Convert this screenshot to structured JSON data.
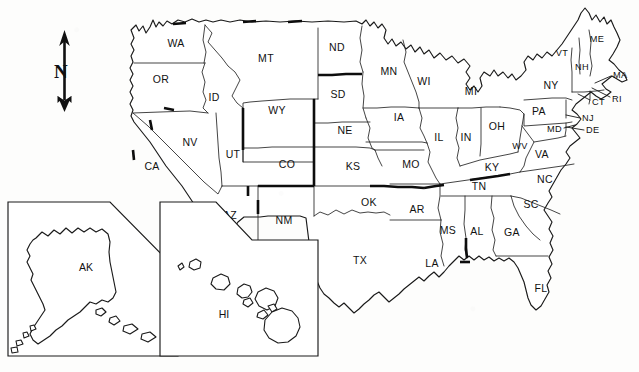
{
  "document": {
    "kind": "outline-map",
    "title": "United States — State Outline Map",
    "region": "United States of America",
    "projection_note": "lower 48 with Alaska and Hawaii insets"
  },
  "compass": {
    "name": "north-arrow",
    "label": "N",
    "direction": "north",
    "x": 65,
    "y": 72
  },
  "legend": {
    "bold_border_meaning": "emphasized / highlighted state boundaries"
  },
  "insets": [
    {
      "id": "ak",
      "label": "AK",
      "name": "Alaska",
      "label_x": 86,
      "label_y": 268
    },
    {
      "id": "hi",
      "label": "HI",
      "name": "Hawaii",
      "label_x": 224,
      "label_y": 315
    }
  ],
  "states": [
    {
      "code": "WA",
      "name": "Washington",
      "x": 176,
      "y": 44,
      "size": "md",
      "leader": null
    },
    {
      "code": "OR",
      "name": "Oregon",
      "x": 161,
      "y": 80,
      "size": "md",
      "leader": null
    },
    {
      "code": "ID",
      "name": "Idaho",
      "x": 214,
      "y": 98,
      "size": "md",
      "leader": null
    },
    {
      "code": "MT",
      "name": "Montana",
      "x": 266,
      "y": 59,
      "size": "md",
      "leader": null
    },
    {
      "code": "WY",
      "name": "Wyoming",
      "x": 277,
      "y": 111,
      "size": "md",
      "leader": null
    },
    {
      "code": "CA",
      "name": "California",
      "x": 152,
      "y": 167,
      "size": "md",
      "leader": null
    },
    {
      "code": "NV",
      "name": "Nevada",
      "x": 190,
      "y": 143,
      "size": "md",
      "leader": null
    },
    {
      "code": "UT",
      "name": "Utah",
      "x": 233,
      "y": 155,
      "size": "md",
      "leader": null
    },
    {
      "code": "AZ",
      "name": "Arizona",
      "x": 230,
      "y": 216,
      "size": "md",
      "leader": null
    },
    {
      "code": "CO",
      "name": "Colorado",
      "x": 287,
      "y": 165,
      "size": "md",
      "leader": null
    },
    {
      "code": "NM",
      "name": "New Mexico",
      "x": 284,
      "y": 221,
      "size": "md",
      "leader": null
    },
    {
      "code": "ND",
      "name": "North Dakota",
      "x": 337,
      "y": 48,
      "size": "md",
      "leader": null
    },
    {
      "code": "SD",
      "name": "South Dakota",
      "x": 338,
      "y": 95,
      "size": "md",
      "leader": null
    },
    {
      "code": "NE",
      "name": "Nebraska",
      "x": 345,
      "y": 131,
      "size": "md",
      "leader": null
    },
    {
      "code": "KS",
      "name": "Kansas",
      "x": 353,
      "y": 167,
      "size": "md",
      "leader": null
    },
    {
      "code": "OK",
      "name": "Oklahoma",
      "x": 369,
      "y": 203,
      "size": "md",
      "leader": null
    },
    {
      "code": "TX",
      "name": "Texas",
      "x": 360,
      "y": 261,
      "size": "md",
      "leader": null
    },
    {
      "code": "MN",
      "name": "Minnesota",
      "x": 389,
      "y": 72,
      "size": "md",
      "leader": null
    },
    {
      "code": "IA",
      "name": "Iowa",
      "x": 399,
      "y": 118,
      "size": "md",
      "leader": null
    },
    {
      "code": "MO",
      "name": "Missouri",
      "x": 411,
      "y": 165,
      "size": "md",
      "leader": null
    },
    {
      "code": "AR",
      "name": "Arkansas",
      "x": 417,
      "y": 210,
      "size": "md",
      "leader": null
    },
    {
      "code": "LA",
      "name": "Louisiana",
      "x": 432,
      "y": 264,
      "size": "md",
      "leader": null
    },
    {
      "code": "WI",
      "name": "Wisconsin",
      "x": 424,
      "y": 82,
      "size": "md",
      "leader": null
    },
    {
      "code": "IL",
      "name": "Illinois",
      "x": 439,
      "y": 138,
      "size": "md",
      "leader": null
    },
    {
      "code": "MS",
      "name": "Mississippi",
      "x": 448,
      "y": 231,
      "size": "md",
      "leader": null
    },
    {
      "code": "MI",
      "name": "Michigan",
      "x": 471,
      "y": 92,
      "size": "md",
      "leader": null
    },
    {
      "code": "IN",
      "name": "Indiana",
      "x": 466,
      "y": 138,
      "size": "md",
      "leader": null
    },
    {
      "code": "OH",
      "name": "Ohio",
      "x": 497,
      "y": 127,
      "size": "md",
      "leader": null
    },
    {
      "code": "KY",
      "name": "Kentucky",
      "x": 492,
      "y": 168,
      "size": "md",
      "leader": null
    },
    {
      "code": "TN",
      "name": "Tennessee",
      "x": 479,
      "y": 187,
      "size": "md",
      "leader": null
    },
    {
      "code": "AL",
      "name": "Alabama",
      "x": 477,
      "y": 232,
      "size": "md",
      "leader": null
    },
    {
      "code": "GA",
      "name": "Georgia",
      "x": 512,
      "y": 233,
      "size": "md",
      "leader": null
    },
    {
      "code": "FL",
      "name": "Florida",
      "x": 541,
      "y": 289,
      "size": "md",
      "leader": null
    },
    {
      "code": "SC",
      "name": "South Carolina",
      "x": 531,
      "y": 205,
      "size": "md",
      "leader": null
    },
    {
      "code": "NC",
      "name": "North Carolina",
      "x": 545,
      "y": 180,
      "size": "md",
      "leader": null
    },
    {
      "code": "VA",
      "name": "Virginia",
      "x": 542,
      "y": 155,
      "size": "md",
      "leader": null
    },
    {
      "code": "WV",
      "name": "West Virginia",
      "x": 520,
      "y": 147,
      "size": "sm",
      "leader": null
    },
    {
      "code": "PA",
      "name": "Pennsylvania",
      "x": 539,
      "y": 112,
      "size": "md",
      "leader": null
    },
    {
      "code": "NY",
      "name": "New York",
      "x": 551,
      "y": 86,
      "size": "md",
      "leader": null
    },
    {
      "code": "VT",
      "name": "Vermont",
      "x": 562,
      "y": 54,
      "size": "sm",
      "leader": null
    },
    {
      "code": "NH",
      "name": "New Hampshire",
      "x": 582,
      "y": 68,
      "size": "sm",
      "leader": null
    },
    {
      "code": "ME",
      "name": "Maine",
      "x": 597,
      "y": 40,
      "size": "sm",
      "leader": null
    },
    {
      "code": "MA",
      "name": "Massachusetts",
      "x": 618,
      "y": 76,
      "size": "sm",
      "leader": {
        "x1": 611,
        "y1": 76,
        "x2": 595,
        "y2": 83
      }
    },
    {
      "code": "CT",
      "name": "Connecticut",
      "x": 594,
      "y": 103,
      "size": "sm",
      "leader": {
        "x1": 590,
        "y1": 100,
        "x2": 578,
        "y2": 94
      }
    },
    {
      "code": "RI",
      "name": "Rhode Island",
      "x": 613,
      "y": 100,
      "size": "sm",
      "leader": {
        "x1": 610,
        "y1": 97,
        "x2": 592,
        "y2": 88
      }
    },
    {
      "code": "NJ",
      "name": "New Jersey",
      "x": 587,
      "y": 119,
      "size": "sm",
      "leader": {
        "x1": 580,
        "y1": 118,
        "x2": 566,
        "y2": 115
      }
    },
    {
      "code": "DE",
      "name": "Delaware",
      "x": 592,
      "y": 131,
      "size": "sm",
      "leader": {
        "x1": 584,
        "y1": 130,
        "x2": 566,
        "y2": 127
      }
    },
    {
      "code": "MD",
      "name": "Maryland",
      "x": 555,
      "y": 130,
      "size": "sm",
      "leader": {
        "x1": 564,
        "y1": 128,
        "x2": 575,
        "y2": 125
      }
    }
  ],
  "counts": {
    "labeled_states": 50,
    "insets": 2
  }
}
